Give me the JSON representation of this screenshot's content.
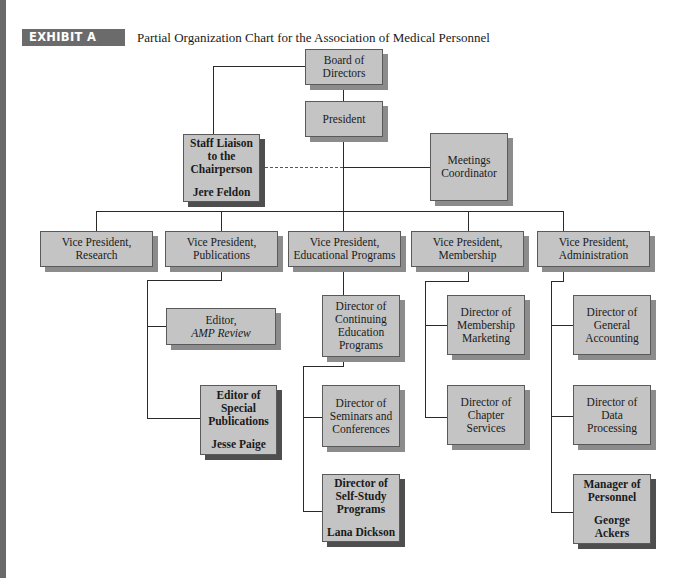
{
  "page": {
    "cut_off_line": "...g ... g",
    "badge": "EXHIBIT A",
    "title": "Partial Organization Chart for the Association of Medical Personnel"
  },
  "chart": {
    "board": {
      "label": "Board of Directors"
    },
    "president": {
      "label": "President"
    },
    "staff_liaison": {
      "title": "Staff Liaison to the Chairperson",
      "person": "Jere Feldon"
    },
    "meetings": {
      "label": "Meetings Coordinator"
    },
    "vps": [
      {
        "label": "Vice President, Research"
      },
      {
        "label": "Vice President, Publications"
      },
      {
        "label": "Vice President, Educational Programs"
      },
      {
        "label": "Vice President, Membership"
      },
      {
        "label": "Vice President, Administration"
      }
    ],
    "publications": [
      {
        "label": "Editor,",
        "italic": "AMP Review"
      },
      {
        "title": "Editor of Special Publications",
        "person": "Jesse Paige"
      }
    ],
    "education": [
      {
        "label": "Director of Continuing Education Programs"
      },
      {
        "label": "Director of Seminars and Conferences"
      },
      {
        "title": "Director of Self-Study Programs",
        "person": "Lana Dickson"
      }
    ],
    "membership": [
      {
        "label": "Director of Membership Marketing"
      },
      {
        "label": "Director of Chapter Services"
      }
    ],
    "administration": [
      {
        "label": "Director of General Accounting"
      },
      {
        "label": "Director of Data Processing"
      },
      {
        "title": "Manager of Personnel",
        "person": "George Ackers"
      }
    ]
  },
  "colors": {
    "box_fill": "#c4c4c4",
    "shadow": "#8c8c8c",
    "key_shadow": "#4e4e4e",
    "badge": "#6b6b6b"
  }
}
